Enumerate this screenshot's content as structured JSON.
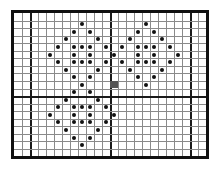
{
  "board": {
    "cols": 24,
    "rows": 19,
    "cell_width": 8,
    "cell_height": 7.55,
    "thick_col_lines_after": [
      1,
      11,
      21
    ],
    "thick_row_lines_after": [
      10
    ],
    "grid_line_color": "#8a8a8a",
    "thick_line_color": "#1a1a1a",
    "border_color": "#111111"
  },
  "marker": {
    "col": 12,
    "row": 9,
    "color": "#555555"
  },
  "dots": [
    {
      "col": 8,
      "row": 1
    },
    {
      "col": 16,
      "row": 1
    },
    {
      "col": 7,
      "row": 2
    },
    {
      "col": 9,
      "row": 2
    },
    {
      "col": 15,
      "row": 2
    },
    {
      "col": 17,
      "row": 2
    },
    {
      "col": 6,
      "row": 3
    },
    {
      "col": 10,
      "row": 3
    },
    {
      "col": 14,
      "row": 3
    },
    {
      "col": 18,
      "row": 3
    },
    {
      "col": 5,
      "row": 4
    },
    {
      "col": 7,
      "row": 4
    },
    {
      "col": 8,
      "row": 4
    },
    {
      "col": 9,
      "row": 4
    },
    {
      "col": 11,
      "row": 4
    },
    {
      "col": 13,
      "row": 4
    },
    {
      "col": 15,
      "row": 4
    },
    {
      "col": 16,
      "row": 4
    },
    {
      "col": 17,
      "row": 4
    },
    {
      "col": 19,
      "row": 4
    },
    {
      "col": 4,
      "row": 5
    },
    {
      "col": 7,
      "row": 5
    },
    {
      "col": 9,
      "row": 5
    },
    {
      "col": 12,
      "row": 5
    },
    {
      "col": 15,
      "row": 5
    },
    {
      "col": 17,
      "row": 5
    },
    {
      "col": 20,
      "row": 5
    },
    {
      "col": 5,
      "row": 6
    },
    {
      "col": 7,
      "row": 6
    },
    {
      "col": 8,
      "row": 6
    },
    {
      "col": 9,
      "row": 6
    },
    {
      "col": 11,
      "row": 6
    },
    {
      "col": 13,
      "row": 6
    },
    {
      "col": 15,
      "row": 6
    },
    {
      "col": 16,
      "row": 6
    },
    {
      "col": 17,
      "row": 6
    },
    {
      "col": 19,
      "row": 6
    },
    {
      "col": 6,
      "row": 7
    },
    {
      "col": 10,
      "row": 7
    },
    {
      "col": 14,
      "row": 7
    },
    {
      "col": 18,
      "row": 7
    },
    {
      "col": 7,
      "row": 8
    },
    {
      "col": 9,
      "row": 8
    },
    {
      "col": 15,
      "row": 8
    },
    {
      "col": 17,
      "row": 8
    },
    {
      "col": 8,
      "row": 9
    },
    {
      "col": 16,
      "row": 9
    },
    {
      "col": 7,
      "row": 10
    },
    {
      "col": 9,
      "row": 10
    },
    {
      "col": 6,
      "row": 11
    },
    {
      "col": 10,
      "row": 11
    },
    {
      "col": 5,
      "row": 12
    },
    {
      "col": 7,
      "row": 12
    },
    {
      "col": 8,
      "row": 12
    },
    {
      "col": 9,
      "row": 12
    },
    {
      "col": 11,
      "row": 12
    },
    {
      "col": 4,
      "row": 13
    },
    {
      "col": 7,
      "row": 13
    },
    {
      "col": 9,
      "row": 13
    },
    {
      "col": 12,
      "row": 13
    },
    {
      "col": 5,
      "row": 14
    },
    {
      "col": 7,
      "row": 14
    },
    {
      "col": 8,
      "row": 14
    },
    {
      "col": 9,
      "row": 14
    },
    {
      "col": 11,
      "row": 14
    },
    {
      "col": 6,
      "row": 15
    },
    {
      "col": 10,
      "row": 15
    },
    {
      "col": 7,
      "row": 16
    },
    {
      "col": 9,
      "row": 16
    },
    {
      "col": 8,
      "row": 17
    }
  ]
}
